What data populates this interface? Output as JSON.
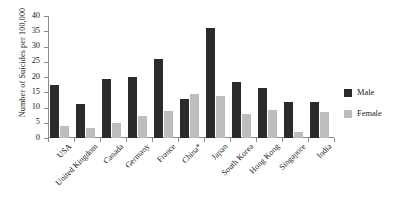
{
  "chart_data": {
    "type": "bar",
    "title": "",
    "xlabel": "",
    "ylabel": "Number of Suicides per 100,000",
    "ylim": [
      0,
      40
    ],
    "ytick_step": 5,
    "yticks": [
      40,
      35,
      30,
      25,
      20,
      15,
      10,
      5,
      0
    ],
    "grid": false,
    "legend_position": "right",
    "categories": [
      "USA",
      "United Kingdom",
      "Canada",
      "Germany",
      "France",
      "China*",
      "Japan",
      "South Korea",
      "Hong Kong",
      "Singapore",
      "India"
    ],
    "series": [
      {
        "name": "Male",
        "color": "#2b2b2b",
        "values": [
          17.4,
          11.0,
          19.5,
          20.0,
          26.0,
          12.7,
          36.1,
          18.4,
          16.4,
          11.8,
          11.8
        ]
      },
      {
        "name": "Female",
        "color": "#bdbdbd",
        "values": [
          4.0,
          3.2,
          4.8,
          7.2,
          9.0,
          14.4,
          13.7,
          7.8,
          9.2,
          1.9,
          8.4
        ]
      }
    ],
    "annotations": [
      "* China figure marked with asterisk"
    ]
  },
  "legend": {
    "items": [
      {
        "label": "Male",
        "swatch": "male-swatch"
      },
      {
        "label": "Female",
        "swatch": "female-swatch"
      }
    ]
  }
}
